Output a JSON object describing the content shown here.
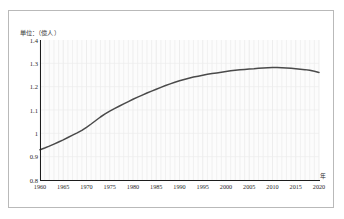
{
  "figure": {
    "unit_caption": "単位：（億人）",
    "x_axis_unit": "年",
    "line_color": "#4a4a4a",
    "grid_color": "#e2e2e2",
    "axis_color": "#1d1d1d",
    "frame_color": "#b9b9b9",
    "plot_background": "#fcfcfc"
  },
  "chart_data": {
    "type": "line",
    "title": "",
    "subtitle": "",
    "xlabel": "年",
    "ylabel": "",
    "unit": "億人",
    "unit_caption": "単位：（億人）",
    "xlim": [
      1960,
      2020
    ],
    "ylim": [
      0.8,
      1.4
    ],
    "grid": true,
    "grid_x_step": 1,
    "grid_y_step": 0.1,
    "legend": false,
    "legend_position": "none",
    "xtick_labels": [
      "1960",
      "1965",
      "1970",
      "1975",
      "1980",
      "1985",
      "1990",
      "1995",
      "2000",
      "2005",
      "2010",
      "2015",
      "2020"
    ],
    "xticks": [
      1960,
      1965,
      1970,
      1975,
      1980,
      1985,
      1990,
      1995,
      2000,
      2005,
      2010,
      2015,
      2020
    ],
    "ytick_labels": [
      "0.8",
      "0.9",
      "1",
      "1.1",
      "1.2",
      "1.3",
      "1.4"
    ],
    "yticks": [
      0.8,
      0.9,
      1.0,
      1.1,
      1.2,
      1.3,
      1.4
    ],
    "series": [
      {
        "name": "人口",
        "x": [
          1960,
          1961,
          1962,
          1963,
          1964,
          1965,
          1966,
          1967,
          1968,
          1969,
          1970,
          1971,
          1972,
          1973,
          1974,
          1975,
          1976,
          1977,
          1978,
          1979,
          1980,
          1981,
          1982,
          1983,
          1984,
          1985,
          1986,
          1987,
          1988,
          1989,
          1990,
          1991,
          1992,
          1993,
          1994,
          1995,
          1996,
          1997,
          1998,
          1999,
          2000,
          2001,
          2002,
          2003,
          2004,
          2005,
          2006,
          2007,
          2008,
          2009,
          2010,
          2011,
          2012,
          2013,
          2014,
          2015,
          2016,
          2017,
          2018,
          2019,
          2020
        ],
        "values": [
          0.93,
          0.937,
          0.945,
          0.954,
          0.963,
          0.972,
          0.982,
          0.992,
          1.002,
          1.013,
          1.026,
          1.04,
          1.055,
          1.07,
          1.083,
          1.095,
          1.106,
          1.116,
          1.126,
          1.136,
          1.146,
          1.155,
          1.164,
          1.173,
          1.181,
          1.189,
          1.197,
          1.205,
          1.212,
          1.219,
          1.225,
          1.231,
          1.236,
          1.241,
          1.245,
          1.249,
          1.253,
          1.256,
          1.259,
          1.262,
          1.265,
          1.268,
          1.27,
          1.272,
          1.274,
          1.276,
          1.277,
          1.279,
          1.28,
          1.281,
          1.282,
          1.282,
          1.281,
          1.28,
          1.279,
          1.277,
          1.275,
          1.273,
          1.27,
          1.266,
          1.261
        ]
      }
    ]
  }
}
